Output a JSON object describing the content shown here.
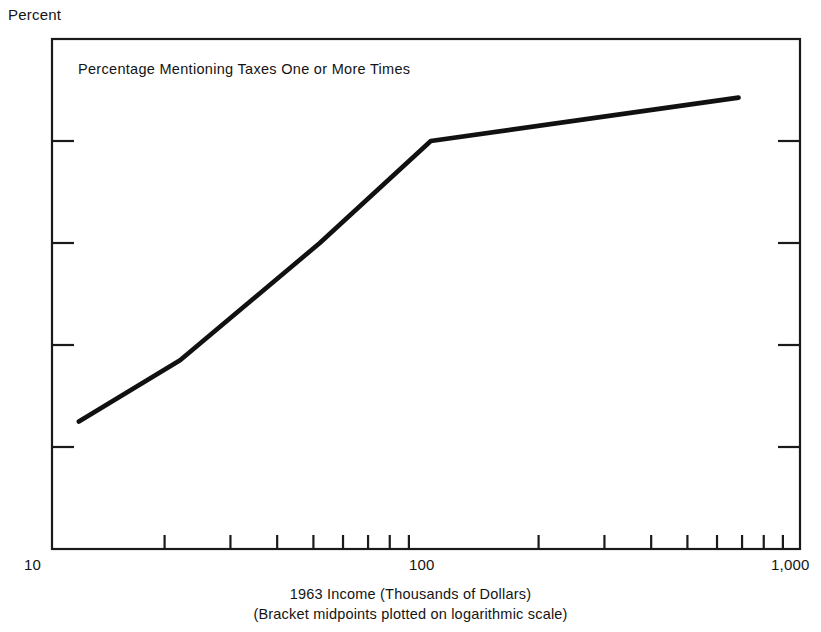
{
  "figure": {
    "y_axis_title": "Percent",
    "plot_title": "Percentage Mentioning Taxes One or More Times",
    "x_caption_line1": "1963 Income (Thousands of Dollars)",
    "x_caption_line2": "(Bracket midpoints plotted on logarithmic scale)",
    "x_label_left": "10",
    "x_label_mid": "100",
    "x_label_right": "1,000",
    "line_color": "#111111",
    "axis_color": "#1a1a1a",
    "background": "#ffffff"
  },
  "chart_data": {
    "type": "line",
    "title": "Percentage Mentioning Taxes One or More Times",
    "xlabel": "1963 Income (Thousands of Dollars)",
    "xlabel_sub": "(Bracket midpoints plotted on logarithmic scale)",
    "ylabel": "Percent",
    "xscale": "log",
    "xlim": [
      10,
      1000
    ],
    "ylim": [
      0,
      100
    ],
    "grid": false,
    "legend": "none",
    "y_ticks": [
      0,
      20,
      40,
      60,
      80,
      100
    ],
    "y_tick_labels": [
      "0",
      "20",
      "40",
      "60",
      "80",
      "100"
    ],
    "x_major_ticks": [
      10,
      100,
      1000
    ],
    "x_major_tick_labels": [
      "10",
      "100",
      "1,000"
    ],
    "x_minor_ticks": [
      20,
      30,
      40,
      50,
      60,
      70,
      80,
      90,
      200,
      300,
      400,
      500,
      600,
      700,
      800,
      900
    ],
    "series": [
      {
        "name": "Percentage mentioning taxes one or more times",
        "x": [
          11.8,
          22,
          52,
          103,
          685
        ],
        "y": [
          25,
          37,
          60,
          80,
          88.5
        ]
      }
    ]
  }
}
